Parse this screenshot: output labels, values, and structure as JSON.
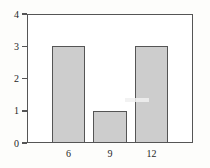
{
  "chart_data": {
    "type": "bar",
    "title": "",
    "subtitle": "",
    "xlabel": "",
    "ylabel": "",
    "categories": [
      "6",
      "9",
      "12"
    ],
    "values": [
      3,
      1,
      3
    ],
    "series": [
      {
        "name": "frequency",
        "values": [
          3,
          1,
          3
        ]
      }
    ],
    "xlim": [
      3,
      15
    ],
    "ylim": [
      0,
      4
    ],
    "y_ticks": [
      "0",
      "1",
      "2",
      "3",
      "4"
    ],
    "y_tick_values": [
      0,
      1,
      2,
      3,
      4
    ],
    "x_ticks": [
      "6",
      "9",
      "12"
    ],
    "grid": false,
    "legend": false,
    "legend_position": "none",
    "bar_fill_color": "#cdcdcd",
    "bar_border_color": "#555555",
    "frame_color": "#555555",
    "plot_background": "#ffffff",
    "page_background": "#fdfdfb",
    "text_color": "#262626"
  },
  "annotations": {
    "scan_artifact_label": ""
  }
}
